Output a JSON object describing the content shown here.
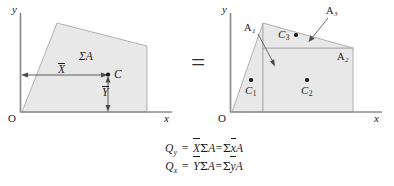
{
  "figure": {
    "caption_equals": "=",
    "left_diagram": {
      "name": "composite-area-centroid",
      "axis_y_label": "y",
      "axis_x_label": "x",
      "origin_label": "O",
      "area_label": "ΣA",
      "centroid_point_label": "C",
      "xbar_label": "X",
      "ybar_label": "Y",
      "shape_fill": "#e8e8e8",
      "shape_stroke": "#9a9a9a",
      "axis_color": "#8c8c8c",
      "shape_vertices": "origin, apex-top-left, top-right, bottom-right"
    },
    "right_diagram": {
      "name": "decomposed-areas",
      "axis_y_label": "y",
      "axis_x_label": "x",
      "origin_label": "O",
      "parts": [
        {
          "area_label": "A",
          "area_sub": "1",
          "centroid_label": "C",
          "centroid_sub": "1",
          "shape": "triangle-left"
        },
        {
          "area_label": "A",
          "area_sub": "2",
          "centroid_label": "C",
          "centroid_sub": "2",
          "shape": "rectangle-bottom-right"
        },
        {
          "area_label": "A",
          "area_sub": "3",
          "centroid_label": "C",
          "centroid_sub": "3",
          "shape": "triangle-top-right"
        }
      ],
      "shape_fill": "#e8e8e8",
      "shape_stroke": "#9a9a9a",
      "axis_color": "#8c8c8c"
    }
  },
  "equations": [
    {
      "lhs_symbol": "Q",
      "lhs_sub": "y",
      "equals": "=",
      "term1_bar": "X",
      "term1_sigma": "Σ",
      "term1_area": "A",
      "mid_equals": "=",
      "term2_sigma": "Σ",
      "term2_bar": "x",
      "term2_area": "A"
    },
    {
      "lhs_symbol": "Q",
      "lhs_sub": "x",
      "equals": "=",
      "term1_bar": "Y",
      "term1_sigma": "Σ",
      "term1_area": "A",
      "mid_equals": "=",
      "term2_sigma": "Σ",
      "term2_bar": "y",
      "term2_area": "A"
    }
  ]
}
